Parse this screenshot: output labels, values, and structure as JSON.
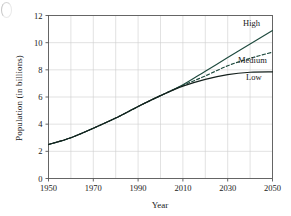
{
  "figure": {
    "artifact_name": "page-edge-artifact"
  },
  "chart_data": {
    "type": "line",
    "title": "",
    "xlabel": "Year",
    "ylabel": "Population (in billions)",
    "xlim": [
      1950,
      2050
    ],
    "ylim": [
      0,
      12
    ],
    "grid": true,
    "legend_position": "inline-right-end-labels",
    "x_major_ticks": [
      1950,
      1970,
      1990,
      2010,
      2030,
      2050
    ],
    "x_minor_ticks": [
      1960,
      1980,
      2000,
      2020,
      2040
    ],
    "x_tick_labels": [
      "1950",
      "1970",
      "1990",
      "2010",
      "2030",
      "2050"
    ],
    "y_major_ticks": [
      0,
      2,
      4,
      6,
      8,
      10,
      12
    ],
    "y_tick_labels": [
      "0",
      "2",
      "4",
      "6",
      "8",
      "10",
      "12"
    ],
    "x": [
      1950,
      1960,
      1970,
      1980,
      1990,
      2000,
      2010,
      2020,
      2030,
      2040,
      2050
    ],
    "series": [
      {
        "name": "High",
        "label": "High",
        "style": "solid",
        "color": "#1f4b3f",
        "values": [
          2.5,
          3.0,
          3.7,
          4.45,
          5.3,
          6.1,
          6.9,
          7.9,
          8.9,
          9.9,
          10.9
        ]
      },
      {
        "name": "Medium",
        "label": "Medium",
        "style": "dashed",
        "color": "#1f4b3f",
        "values": [
          2.5,
          3.0,
          3.7,
          4.45,
          5.3,
          6.1,
          6.85,
          7.55,
          8.3,
          8.85,
          9.3
        ]
      },
      {
        "name": "Low",
        "label": "Low",
        "style": "solid",
        "color": "#14201c",
        "values": [
          2.5,
          3.0,
          3.7,
          4.45,
          5.3,
          6.1,
          6.8,
          7.3,
          7.65,
          7.82,
          7.85
        ]
      }
    ],
    "colors": {
      "axis": "#555555",
      "grid": "#cfcfcf",
      "text": "#1a1a1a",
      "background": "#ffffff"
    }
  }
}
